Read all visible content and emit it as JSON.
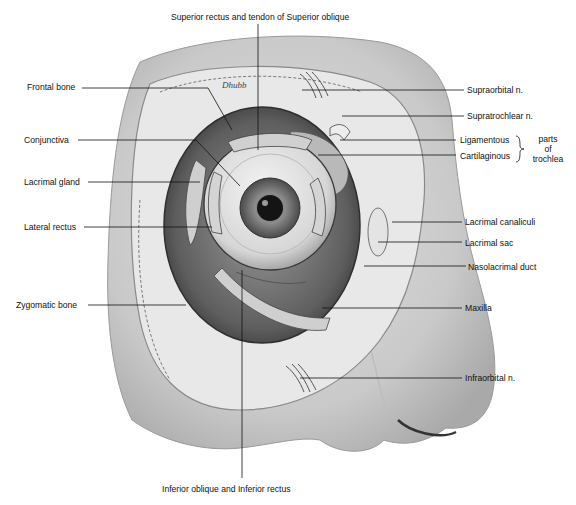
{
  "figure": {
    "signature": "Dhubb"
  },
  "labels": {
    "top": "Superior rectus and tendon of Superior oblique",
    "bottom": "Inferior oblique and Inferior rectus",
    "left": [
      {
        "id": "frontal-bone",
        "text": "Frontal bone"
      },
      {
        "id": "conjunctiva",
        "text": "Conjunctiva"
      },
      {
        "id": "lacrimal-gland",
        "text": "Lacrimal gland"
      },
      {
        "id": "lateral-rectus",
        "text": "Lateral rectus"
      },
      {
        "id": "zygomatic-bone",
        "text": "Zygomatic bone"
      }
    ],
    "right": [
      {
        "id": "supraorbital-n",
        "text": "Supraorbital n."
      },
      {
        "id": "supratrochlear-n",
        "text": "Supratrochlear n."
      },
      {
        "id": "ligamentous",
        "text": "Ligamentous"
      },
      {
        "id": "cartilaginous",
        "text": "Cartilaginous"
      },
      {
        "id": "lacrimal-canaliculi",
        "text": "Lacrimal canaliculi"
      },
      {
        "id": "lacrimal-sac",
        "text": "Lacrimal sac"
      },
      {
        "id": "nasolacrimal-duct",
        "text": "Nasolacrimal duct"
      },
      {
        "id": "maxilla",
        "text": "Maxilla"
      },
      {
        "id": "infraorbital-n",
        "text": "Infraorbital n."
      }
    ],
    "trochlea_group": {
      "line1": "parts",
      "line2": "of",
      "line3": "trochlea"
    }
  },
  "colors": {
    "background": "#ffffff",
    "skin": "#d9d9d9",
    "bone": "#e6e6e6",
    "orbit_dark": "#6e6e6e",
    "ink": "#111111"
  }
}
